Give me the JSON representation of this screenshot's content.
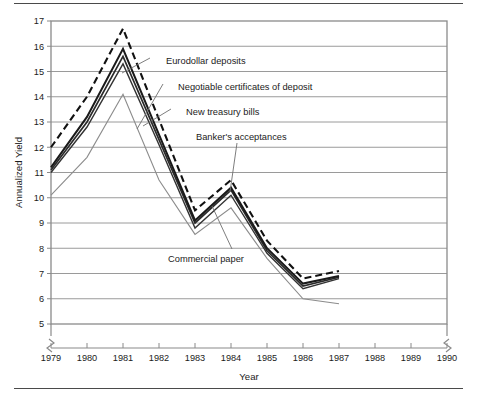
{
  "figure": {
    "y_axis_title": "Annualized Yield",
    "x_axis_title": "Year"
  },
  "chart_data": {
    "type": "line",
    "title": "",
    "xlabel": "Year",
    "ylabel": "Annualized Yield",
    "xlim": [
      1979,
      1990
    ],
    "ylim": [
      5,
      17
    ],
    "grid": true,
    "legend": "inline-annotations",
    "axis_break": "both ends of x-axis",
    "x_tick_labels": [
      "1979",
      "1980",
      "1981",
      "1982",
      "1983",
      "1984",
      "1985",
      "1986",
      "1987",
      "1988",
      "1989",
      "1990"
    ],
    "y_tick_labels": [
      "5",
      "6",
      "7",
      "8",
      "9",
      "10",
      "11",
      "12",
      "13",
      "14",
      "15",
      "16",
      "17"
    ],
    "x": [
      1979,
      1980,
      1981,
      1982,
      1983,
      1984,
      1985,
      1986,
      1987
    ],
    "series": [
      {
        "name": "Eurodollar deposits",
        "style": "dashed-black",
        "color": "#111111",
        "values": [
          12.0,
          14.0,
          16.7,
          13.1,
          9.5,
          10.7,
          8.3,
          6.8,
          7.1
        ]
      },
      {
        "name": "Negotiable certificates of deposit",
        "style": "solid-black-thick",
        "color": "#1a1a1a",
        "values": [
          11.2,
          13.2,
          15.9,
          12.5,
          9.1,
          10.4,
          8.0,
          6.6,
          6.9
        ]
      },
      {
        "name": "Banker's acceptances",
        "style": "solid-black",
        "color": "#2a2a2a",
        "values": [
          11.1,
          13.0,
          15.6,
          12.3,
          9.0,
          10.3,
          7.9,
          6.5,
          6.85
        ]
      },
      {
        "name": "New treasury bills",
        "style": "solid-black-thin",
        "color": "#333333",
        "values": [
          11.0,
          12.8,
          15.3,
          12.1,
          8.8,
          10.1,
          7.8,
          6.4,
          6.8
        ]
      },
      {
        "name": "Commercial paper",
        "style": "solid-gray-thin",
        "color": "#8c8c8c",
        "values": [
          10.1,
          11.6,
          14.1,
          10.7,
          8.55,
          9.6,
          7.6,
          6.0,
          5.8
        ]
      }
    ],
    "annotations": [
      {
        "label": "Eurodollar deposits",
        "text_x": 166,
        "text_y": 61,
        "leader": [
          150,
          58,
          122,
          73
        ]
      },
      {
        "label": "Negotiable certificates of deposit",
        "text_x": 178,
        "text_y": 87,
        "leader": [
          163,
          84,
          137,
          129
        ]
      },
      {
        "label": "New treasury bills",
        "text_x": 186,
        "text_y": 112,
        "leader": [
          171,
          109,
          143,
          126
        ]
      },
      {
        "label": "Banker's acceptances",
        "text_x": 196,
        "text_y": 137,
        "leader": [
          237,
          143,
          230,
          192
        ]
      },
      {
        "label": "Commercial paper",
        "text_x": 168,
        "text_y": 259,
        "leader": [
          232,
          249,
          212,
          206
        ]
      }
    ]
  }
}
